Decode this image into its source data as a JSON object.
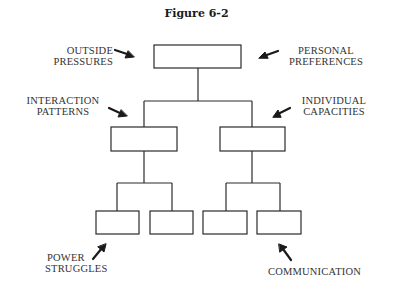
{
  "figure": {
    "title": "Figure 6-2"
  },
  "labels": {
    "outside_pressures": {
      "line1": "OUTSIDE",
      "line2": "PRESSURES"
    },
    "personal_preferences": {
      "line1": "PERSONAL",
      "line2": "PREFERENCES"
    },
    "interaction_patterns": {
      "line1": "INTERACTION",
      "line2": "PATTERNS"
    },
    "individual_capacities": {
      "line1": "INDIVIDUAL",
      "line2": "CAPACITIES"
    },
    "power_struggles": {
      "line1": "POWER",
      "line2": "STRUGGLES"
    },
    "communication": {
      "line1": "COMMUNICATION"
    }
  },
  "tree": {
    "levels": 3,
    "root_boxes": 1,
    "middle_boxes": 2,
    "leaf_boxes": 4
  },
  "colors": {
    "line": "#2a2a2a",
    "text": "#333333",
    "background": "#ffffff"
  }
}
